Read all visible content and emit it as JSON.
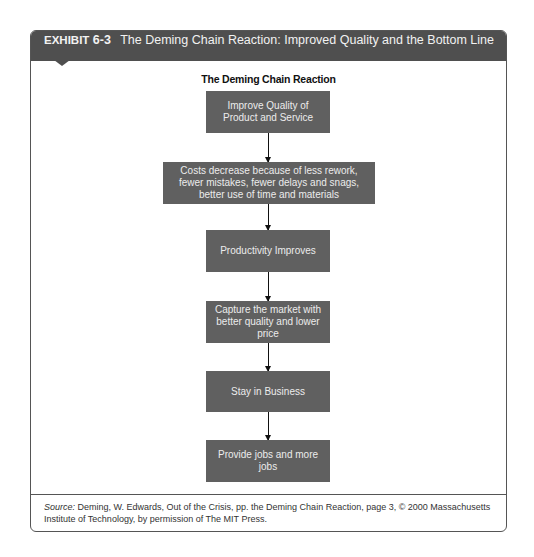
{
  "exhibit": {
    "label": "EXHIBIT",
    "number": "6-3",
    "title": "The Deming Chain Reaction: Improved Quality and the Bottom Line"
  },
  "diagram": {
    "title": "The Deming Chain Reaction",
    "steps": [
      {
        "text": "Improve Quality of Product and Service"
      },
      {
        "text": "Costs decrease because of less rework, fewer mistakes, fewer delays and snags, better use of time and materials"
      },
      {
        "text": "Productivity Improves"
      },
      {
        "text": "Capture the market with better quality and lower price"
      },
      {
        "text": "Stay in Business"
      },
      {
        "text": "Provide jobs and more jobs"
      }
    ],
    "colors": {
      "box": "#606060",
      "box_text": "#ececec",
      "header": "#4f4f4f"
    }
  },
  "source": {
    "label": "Source:",
    "text": " Deming, W. Edwards, Out of the Crisis, pp. the Deming Chain Reaction, page 3, © 2000 Massachusetts Institute of Technology, by permission of The MIT Press."
  }
}
